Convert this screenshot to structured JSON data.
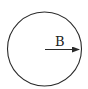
{
  "diagram": {
    "region": {
      "shape": "circle",
      "stroke_color": "#2a2a2a"
    },
    "vector": {
      "label": "B",
      "direction": "right",
      "color": "#2a2a2a"
    }
  }
}
